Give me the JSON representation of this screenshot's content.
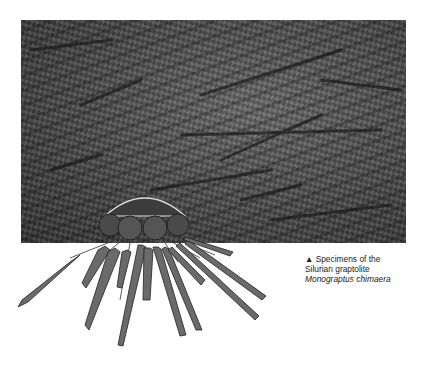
{
  "photo": {
    "alt": "Fossil slab with graptolite specimens"
  },
  "illustration": {
    "alt": "Reconstruction of graptolite colony with float and radiating rhabdosomes"
  },
  "caption": {
    "marker": "▲",
    "line1": "Specimens of the",
    "line2": "Silurian graptolite",
    "line3": "Monograptus chimaera"
  }
}
